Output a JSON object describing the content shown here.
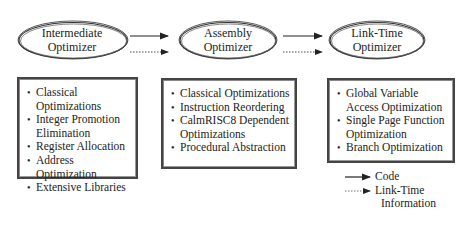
{
  "diagram": {
    "nodes": [
      {
        "id": "intermediate",
        "label_line1": "Intermediate",
        "label_line2": "Optimizer",
        "items": [
          "Classical Optimizations",
          "Integer Promotion Elimination",
          "Register Allocation",
          "Address Optimization",
          "Extensive Libraries"
        ],
        "items_display": [
          "Classical",
          "Optimizations",
          "Integer Promotion",
          "Elimination",
          "Register Allocation",
          "Address Optimization",
          "Extensive Libraries"
        ]
      },
      {
        "id": "assembly",
        "label_line1": "Assembly",
        "label_line2": "Optimizer",
        "items": [
          "Classical Optimizations",
          "Instruction Reordering",
          "CalmRISC8 Dependent Optimizations",
          "Procedural Abstraction"
        ],
        "items_display": [
          "Classical Optimizations",
          "Instruction Reordering",
          "CalmRISC8 Dependent",
          "Optimizations",
          "Procedural Abstraction"
        ]
      },
      {
        "id": "linktime",
        "label_line1": "Link-Time",
        "label_line2": "Optimizer",
        "items": [
          "Global Variable Access Optimization",
          "Single Page Function Optimization",
          "Branch Optimization"
        ],
        "items_display": [
          "Global Variable",
          "Access Optimization",
          "Single Page Function",
          "Optimization",
          "Branch Optimization"
        ]
      }
    ],
    "edges": [
      {
        "from": "intermediate",
        "to": "assembly",
        "type": "code"
      },
      {
        "from": "intermediate",
        "to": "assembly",
        "type": "link-time-information"
      },
      {
        "from": "assembly",
        "to": "linktime",
        "type": "code"
      },
      {
        "from": "assembly",
        "to": "linktime",
        "type": "link-time-information"
      }
    ],
    "legend": {
      "code_label": "Code",
      "linktime_label_line1": "Link-Time",
      "linktime_label_line2": "Information"
    },
    "colors": {
      "stroke": "#333333",
      "background": "#ffffff"
    }
  }
}
